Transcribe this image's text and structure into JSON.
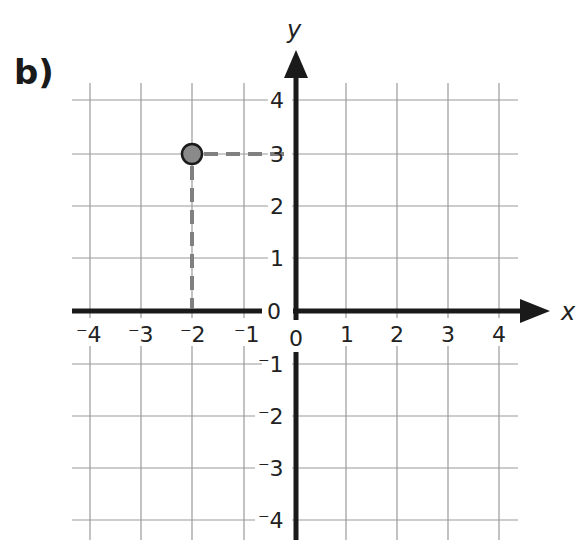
{
  "part_label": "b)",
  "axes": {
    "x_label": "x",
    "y_label": "y",
    "x_ticks": [
      "⁻4",
      "⁻3",
      "⁻2",
      "⁻1",
      "0",
      "1",
      "2",
      "3",
      "4"
    ],
    "y_ticks": [
      "4",
      "3",
      "2",
      "1",
      "0",
      "⁻1",
      "⁻2",
      "⁻3",
      "⁻4"
    ]
  },
  "point": {
    "x": -2,
    "y": 3,
    "fill": "#8a8a8a",
    "stroke": "#1a1a1a"
  },
  "guides": {
    "color": "#808080",
    "style": "dashed"
  },
  "colors": {
    "grid": "#9a9a9a",
    "axis": "#1a1a1a"
  }
}
